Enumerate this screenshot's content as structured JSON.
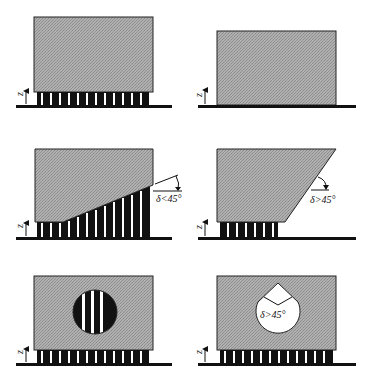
{
  "figure": {
    "type": "support-structure overhang diagrams",
    "panels": [
      {
        "id": "top-left",
        "description": "Rectangular part fully supported by vertical support struts",
        "axis_label": "z",
        "annotation": ""
      },
      {
        "id": "top-right",
        "description": "Rectangular part sitting directly on base plate, no supports",
        "axis_label": "z",
        "annotation": ""
      },
      {
        "id": "middle-left",
        "description": "Part with shallow inclined underside requiring supports",
        "axis_label": "z",
        "annotation": "δ<45°"
      },
      {
        "id": "middle-right",
        "description": "Part with steep inclined side, self-supporting",
        "axis_label": "z",
        "annotation": "δ>45°"
      },
      {
        "id": "bottom-left",
        "description": "Part with circular internal hole filled with supports",
        "axis_label": "z",
        "annotation": ""
      },
      {
        "id": "bottom-right",
        "description": "Part with teardrop-shaped internal hole, self-supporting",
        "axis_label": "z",
        "annotation": "δ>45°"
      }
    ]
  },
  "labels": {
    "z": "z",
    "delta_lt_45": "δ<45°",
    "delta_gt_45": "δ>45°"
  },
  "colors": {
    "part_fill": "#a8a8a8",
    "support_fill": "#111111",
    "gap_fill": "#ffffff",
    "ground": "#111111",
    "outline": "#222222"
  }
}
